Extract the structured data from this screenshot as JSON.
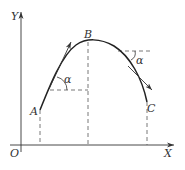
{
  "diagram": {
    "type": "projectile-trajectory",
    "axes": {
      "origin_label": "O",
      "x_label": "X",
      "y_label": "Y"
    },
    "points": [
      {
        "id": "A",
        "label": "A"
      },
      {
        "id": "B",
        "label": "B"
      },
      {
        "id": "C",
        "label": "C"
      }
    ],
    "angles": [
      {
        "id": "alpha-left",
        "label": "α"
      },
      {
        "id": "alpha-right",
        "label": "α"
      }
    ],
    "colors": {
      "stroke": "#333333",
      "dashed": "#555555",
      "background": "#ffffff"
    }
  }
}
